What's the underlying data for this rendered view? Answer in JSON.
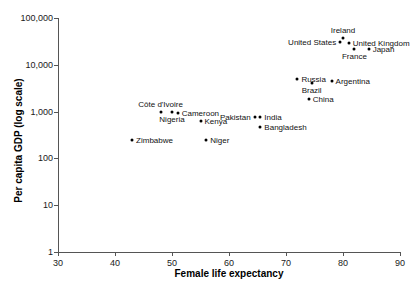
{
  "chart_data": {
    "type": "scatter",
    "title": "",
    "xlabel": "Female life expectancy",
    "ylabel": "Per capita GDP (log scale)",
    "xlim": [
      30,
      90
    ],
    "ylim": [
      1,
      100000
    ],
    "yscale": "log",
    "grid": false,
    "legend": "none",
    "x_ticks": [
      "30",
      "40",
      "50",
      "60",
      "70",
      "80",
      "90"
    ],
    "y_ticks": [
      "1",
      "10",
      "100",
      "1,000",
      "10,000",
      "100,000"
    ],
    "points": [
      {
        "name": "Ireland",
        "x": 80.0,
        "y": 38000,
        "label_pos": "above"
      },
      {
        "name": "United States",
        "x": 79.5,
        "y": 30000,
        "label_pos": "left"
      },
      {
        "name": "United Kingdom",
        "x": 81.0,
        "y": 29000,
        "label_pos": "right"
      },
      {
        "name": "France",
        "x": 82.0,
        "y": 22000,
        "label_pos": "below"
      },
      {
        "name": "Japan",
        "x": 84.5,
        "y": 22000,
        "label_pos": "right"
      },
      {
        "name": "Russia",
        "x": 72.0,
        "y": 5000,
        "label_pos": "right"
      },
      {
        "name": "Brazil",
        "x": 74.5,
        "y": 4000,
        "label_pos": "below"
      },
      {
        "name": "Argentina",
        "x": 78.0,
        "y": 4600,
        "label_pos": "right"
      },
      {
        "name": "China",
        "x": 74.0,
        "y": 1900,
        "label_pos": "right"
      },
      {
        "name": "Pakistan",
        "x": 64.5,
        "y": 750,
        "label_pos": "left"
      },
      {
        "name": "India",
        "x": 65.5,
        "y": 750,
        "label_pos": "right"
      },
      {
        "name": "Bangladesh",
        "x": 65.5,
        "y": 480,
        "label_pos": "right"
      },
      {
        "name": "Cameroon",
        "x": 51.0,
        "y": 950,
        "label_pos": "right"
      },
      {
        "name": "Kenya",
        "x": 55.0,
        "y": 620,
        "label_pos": "right"
      },
      {
        "name": "Côte d'Ivoire",
        "x": 48.0,
        "y": 980,
        "label_pos": "above"
      },
      {
        "name": "Nigeria",
        "x": 50.0,
        "y": 980,
        "label_pos": "below"
      },
      {
        "name": "Niger",
        "x": 56.0,
        "y": 250,
        "label_pos": "right"
      },
      {
        "name": "Zimbabwe",
        "x": 43.0,
        "y": 250,
        "label_pos": "right"
      }
    ]
  }
}
